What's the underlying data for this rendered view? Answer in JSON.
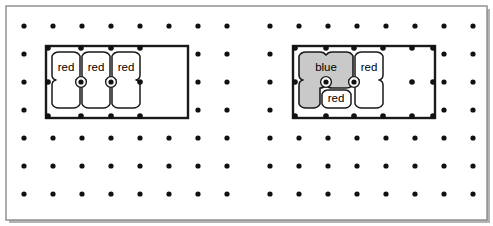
{
  "canvas": {
    "width": 493,
    "height": 226,
    "background_color": "#ffffff",
    "border_color": "#8a8a8a",
    "shadow_color": "#b4b4b4",
    "title": "Pegboard placement diagram"
  },
  "grid": {
    "dot_color": "#111111",
    "dot_radius": 2.6,
    "rows": 7,
    "columns": 16,
    "left_block_columns": 8,
    "right_block_columns": 8,
    "origin_x": 24,
    "origin_y": 26,
    "step_x": 29,
    "step_y": 28,
    "gap_after_column": 8,
    "gap_extra_x": 14,
    "description": "Regular array of peg holes"
  },
  "boards": [
    {
      "id": "left-board",
      "name": "Left board",
      "cols": 4,
      "rows": 2,
      "x": 46,
      "y": 46,
      "width": 142,
      "height": 72,
      "border_color": "#1a1a1a",
      "border_width": 2,
      "fill": "#ffffff",
      "pieces": [
        {
          "id": "left-piece-1",
          "label": "red",
          "color_name": "red",
          "fill": "#ffffff",
          "col": 0,
          "row": 0,
          "col_span": 1,
          "row_span": 2,
          "shape": "tall-octagon"
        },
        {
          "id": "left-piece-2",
          "label": "red",
          "color_name": "red",
          "fill": "#ffffff",
          "col": 1,
          "row": 0,
          "col_span": 1,
          "row_span": 2,
          "shape": "tall-octagon"
        },
        {
          "id": "left-piece-3",
          "label": "red",
          "color_name": "red",
          "fill": "#ffffff",
          "col": 2,
          "row": 0,
          "col_span": 1,
          "row_span": 2,
          "shape": "tall-octagon"
        }
      ],
      "empty_cells": [
        {
          "col": 3,
          "row": 0
        },
        {
          "col": 3,
          "row": 1
        }
      ]
    },
    {
      "id": "right-board",
      "name": "Right board",
      "cols": 4,
      "rows": 2,
      "x": 293,
      "y": 46,
      "width": 142,
      "height": 72,
      "border_color": "#1a1a1a",
      "border_width": 2,
      "fill": "#ffffff",
      "pieces": [
        {
          "id": "right-piece-blue",
          "label": "blue",
          "color_name": "blue",
          "fill": "#c9c9c9",
          "col": 0,
          "row": 0,
          "col_span": 2,
          "row_span": 1,
          "shape": "l-shape",
          "notes": "occupies top-left 2x1 plus bottom-left 1x1"
        },
        {
          "id": "right-piece-red-small",
          "label": "red",
          "color_name": "red",
          "fill": "#ffffff",
          "col": 1,
          "row": 1,
          "col_span": 1,
          "row_span": 1,
          "shape": "octagon"
        },
        {
          "id": "right-piece-red-tall",
          "label": "red",
          "color_name": "red",
          "fill": "#ffffff",
          "col": 2,
          "row": 0,
          "col_span": 1,
          "row_span": 2,
          "shape": "tall-octagon"
        }
      ],
      "empty_cells": [
        {
          "col": 3,
          "row": 0
        },
        {
          "col": 3,
          "row": 1
        }
      ]
    }
  ],
  "legend": {
    "red_label": "red",
    "blue_label": "blue"
  },
  "node_dot": {
    "color": "#111111",
    "radius": 2.6,
    "inner_hole_color": "#ffffff",
    "inner_hole_radius": 5.4
  }
}
